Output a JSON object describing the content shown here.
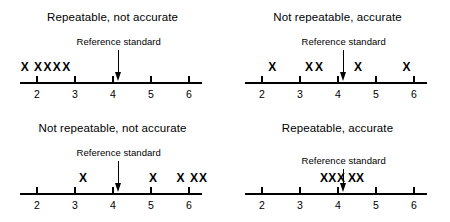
{
  "figure": {
    "title_text": "",
    "reference_label": "Reference standard",
    "axis_tick_labels": [
      "2",
      "3",
      "4",
      "5",
      "6"
    ],
    "ink_color": "#000000",
    "background_color": "#ffffff"
  },
  "panels": [
    {
      "id": "repeatable-not-accurate",
      "title": "Repeatable, not accurate",
      "reference_label": "Reference standard",
      "reference_value": 4.15,
      "tick_labels": [
        "2",
        "3",
        "4",
        "5",
        "6"
      ],
      "tick_values": [
        2,
        3,
        4,
        5,
        6
      ],
      "measurements": [
        1.68,
        2.03,
        2.28,
        2.52,
        2.77
      ],
      "arrow_shaft_height": 22
    },
    {
      "id": "not-repeatable-accurate",
      "title": "Not repeatable, accurate",
      "reference_label": "Reference standard",
      "reference_value": 4.15,
      "tick_labels": [
        "2",
        "3",
        "4",
        "5",
        "6"
      ],
      "tick_values": [
        2,
        3,
        4,
        5,
        6
      ],
      "measurements": [
        2.27,
        3.24,
        3.5,
        4.53,
        5.8
      ],
      "arrow_shaft_height": 22
    },
    {
      "id": "not-repeatable-not-accurate",
      "title": "Not repeatable, not accurate",
      "reference_label": "Reference standard",
      "reference_value": 4.15,
      "tick_labels": [
        "2",
        "3",
        "4",
        "5",
        "6"
      ],
      "tick_values": [
        2,
        3,
        4,
        5,
        6
      ],
      "measurements": [
        3.21,
        5.05,
        5.78,
        6.13,
        6.37
      ],
      "arrow_shaft_height": 22
    },
    {
      "id": "repeatable-accurate",
      "title": "Repeatable, accurate",
      "reference_label": "Reference standard",
      "reference_value": 4.15,
      "tick_labels": [
        "2",
        "3",
        "4",
        "5",
        "6"
      ],
      "tick_values": [
        2,
        3,
        4,
        5,
        6
      ],
      "measurements": [
        3.63,
        3.85,
        4.08,
        4.37,
        4.58
      ],
      "arrow_shaft_height": 14
    }
  ],
  "chart_data": {
    "type": "scatter",
    "xlabel": "",
    "ylabel": "",
    "xlim": [
      1.55,
      6.4
    ],
    "grid": false,
    "legend": "none",
    "axis_ticks": [
      2,
      3,
      4,
      5,
      6
    ],
    "reference_standard_value": 4.15,
    "series": [
      {
        "name": "Repeatable, not accurate",
        "values": [
          1.68,
          2.03,
          2.28,
          2.52,
          2.77
        ]
      },
      {
        "name": "Not repeatable, accurate",
        "values": [
          2.27,
          3.24,
          3.5,
          4.53,
          5.8
        ]
      },
      {
        "name": "Not repeatable, not accurate",
        "values": [
          3.21,
          5.05,
          5.78,
          6.13,
          6.37
        ]
      },
      {
        "name": "Repeatable, accurate",
        "values": [
          3.63,
          3.85,
          4.08,
          4.37,
          4.58
        ]
      }
    ],
    "annotations": [
      "Reference standard"
    ]
  }
}
